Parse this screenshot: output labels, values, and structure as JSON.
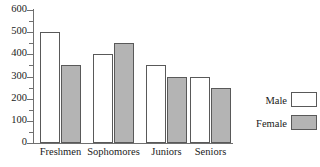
{
  "chart_data": {
    "type": "bar",
    "title": "",
    "xlabel": "",
    "ylabel": "",
    "categories": [
      "Freshmen",
      "Sophomores",
      "Juniors",
      "Seniors"
    ],
    "series": [
      {
        "name": "Male",
        "values": [
          500,
          400,
          350,
          300
        ],
        "color": "#ffffff"
      },
      {
        "name": "Female",
        "values": [
          350,
          450,
          300,
          250
        ],
        "color": "#b4b4b4"
      }
    ],
    "ylim": [
      0,
      600
    ],
    "ytick_labels": [
      "0",
      "100",
      "200",
      "300",
      "400",
      "500",
      "600"
    ],
    "ytick_values": [
      0,
      100,
      200,
      300,
      400,
      500,
      600
    ],
    "yminor_values": [
      50,
      150,
      250,
      350,
      450,
      550
    ],
    "grid": false,
    "legend_position": "right"
  },
  "legend": {
    "entries": [
      {
        "label": "Male"
      },
      {
        "label": "Female"
      }
    ]
  },
  "colors": {
    "axis": "#6f6f6f",
    "bar_outline": "#595959",
    "male_fill": "#ffffff",
    "female_fill": "#b4b4b4",
    "text": "#1a1a1a",
    "background": "#ffffff"
  }
}
